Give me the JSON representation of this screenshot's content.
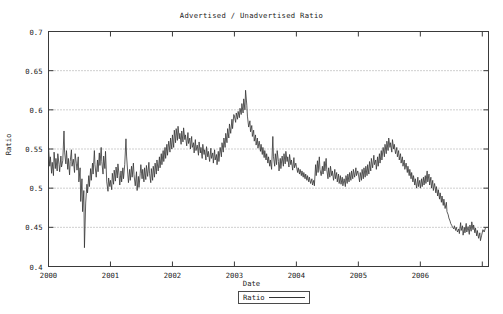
{
  "chart_data": {
    "type": "line",
    "title": "Advertised / Unadvertised Ratio",
    "xlabel": "Date",
    "ylabel": "Ratio",
    "ylim": [
      0.4,
      0.7
    ],
    "xlim": [
      2000.0,
      2007.1
    ],
    "yticks": [
      0.4,
      0.45,
      0.5,
      0.55,
      0.6,
      0.65,
      0.7
    ],
    "ytick_labels": [
      "0.4",
      "0.45",
      "0.5",
      "0.55",
      "0.6",
      "0.65",
      "0.7"
    ],
    "xticks": [
      2000,
      2001,
      2002,
      2003,
      2004,
      2005,
      2006,
      2007
    ],
    "xtick_labels": [
      "2000",
      "2001",
      "2002",
      "2003",
      "2004",
      "2005",
      "2006",
      ""
    ],
    "grid": "horizontal-dotted",
    "legend": {
      "position": "below-plot",
      "entries": [
        "Ratio"
      ]
    },
    "series": [
      {
        "name": "Ratio",
        "color": "#333333",
        "x": [
          2000.0,
          2000.02,
          2000.03,
          2000.05,
          2000.06,
          2000.08,
          2000.09,
          2000.11,
          2000.12,
          2000.14,
          2000.15,
          2000.17,
          2000.18,
          2000.2,
          2000.21,
          2000.23,
          2000.25,
          2000.26,
          2000.28,
          2000.29,
          2000.31,
          2000.32,
          2000.34,
          2000.35,
          2000.37,
          2000.38,
          2000.4,
          2000.42,
          2000.43,
          2000.45,
          2000.46,
          2000.48,
          2000.49,
          2000.51,
          2000.52,
          2000.54,
          2000.55,
          2000.57,
          2000.58,
          2000.6,
          2000.62,
          2000.63,
          2000.65,
          2000.66,
          2000.68,
          2000.69,
          2000.71,
          2000.72,
          2000.74,
          2000.75,
          2000.77,
          2000.79,
          2000.8,
          2000.82,
          2000.83,
          2000.85,
          2000.86,
          2000.88,
          2000.89,
          2000.91,
          2000.92,
          2000.94,
          2000.96,
          2000.97,
          2000.99,
          2001.0,
          2001.02,
          2001.03,
          2001.05,
          2001.06,
          2001.08,
          2001.09,
          2001.11,
          2001.12,
          2001.14,
          2001.15,
          2001.17,
          2001.18,
          2001.2,
          2001.21,
          2001.23,
          2001.25,
          2001.26,
          2001.28,
          2001.29,
          2001.31,
          2001.32,
          2001.34,
          2001.35,
          2001.37,
          2001.38,
          2001.4,
          2001.42,
          2001.43,
          2001.45,
          2001.46,
          2001.48,
          2001.49,
          2001.51,
          2001.52,
          2001.54,
          2001.55,
          2001.57,
          2001.58,
          2001.6,
          2001.62,
          2001.63,
          2001.65,
          2001.66,
          2001.68,
          2001.69,
          2001.71,
          2001.72,
          2001.74,
          2001.75,
          2001.77,
          2001.79,
          2001.8,
          2001.82,
          2001.83,
          2001.85,
          2001.86,
          2001.88,
          2001.89,
          2001.91,
          2001.92,
          2001.94,
          2001.96,
          2001.97,
          2001.99,
          2002.0,
          2002.02,
          2002.03,
          2002.05,
          2002.06,
          2002.08,
          2002.09,
          2002.11,
          2002.12,
          2002.14,
          2002.15,
          2002.17,
          2002.18,
          2002.2,
          2002.21,
          2002.23,
          2002.25,
          2002.26,
          2002.28,
          2002.29,
          2002.31,
          2002.32,
          2002.34,
          2002.35,
          2002.37,
          2002.38,
          2002.4,
          2002.42,
          2002.43,
          2002.45,
          2002.46,
          2002.48,
          2002.49,
          2002.51,
          2002.52,
          2002.54,
          2002.55,
          2002.57,
          2002.58,
          2002.6,
          2002.62,
          2002.63,
          2002.65,
          2002.66,
          2002.68,
          2002.69,
          2002.71,
          2002.72,
          2002.74,
          2002.75,
          2002.77,
          2002.79,
          2002.8,
          2002.82,
          2002.83,
          2002.85,
          2002.86,
          2002.88,
          2002.89,
          2002.91,
          2002.92,
          2002.94,
          2002.96,
          2002.97,
          2002.99,
          2003.0,
          2003.02,
          2003.03,
          2003.05,
          2003.06,
          2003.08,
          2003.09,
          2003.11,
          2003.12,
          2003.14,
          2003.15,
          2003.17,
          2003.18,
          2003.2,
          2003.21,
          2003.23,
          2003.25,
          2003.26,
          2003.28,
          2003.29,
          2003.31,
          2003.32,
          2003.34,
          2003.35,
          2003.37,
          2003.38,
          2003.4,
          2003.42,
          2003.43,
          2003.45,
          2003.46,
          2003.48,
          2003.49,
          2003.51,
          2003.52,
          2003.54,
          2003.55,
          2003.57,
          2003.58,
          2003.6,
          2003.62,
          2003.63,
          2003.65,
          2003.66,
          2003.68,
          2003.69,
          2003.71,
          2003.72,
          2003.74,
          2003.75,
          2003.77,
          2003.79,
          2003.8,
          2003.82,
          2003.83,
          2003.85,
          2003.86,
          2003.88,
          2003.89,
          2003.91,
          2003.92,
          2003.94,
          2003.96,
          2003.97,
          2003.99,
          2004.0,
          2004.02,
          2004.03,
          2004.05,
          2004.06,
          2004.08,
          2004.09,
          2004.11,
          2004.12,
          2004.14,
          2004.15,
          2004.17,
          2004.18,
          2004.2,
          2004.21,
          2004.23,
          2004.25,
          2004.26,
          2004.28,
          2004.29,
          2004.31,
          2004.32,
          2004.34,
          2004.35,
          2004.37,
          2004.38,
          2004.4,
          2004.42,
          2004.43,
          2004.45,
          2004.46,
          2004.48,
          2004.49,
          2004.51,
          2004.52,
          2004.54,
          2004.55,
          2004.57,
          2004.58,
          2004.6,
          2004.62,
          2004.63,
          2004.65,
          2004.66,
          2004.68,
          2004.69,
          2004.71,
          2004.72,
          2004.74,
          2004.75,
          2004.77,
          2004.79,
          2004.8,
          2004.82,
          2004.83,
          2004.85,
          2004.86,
          2004.88,
          2004.89,
          2004.91,
          2004.92,
          2004.94,
          2004.96,
          2004.97,
          2004.99,
          2005.0,
          2005.02,
          2005.03,
          2005.05,
          2005.06,
          2005.08,
          2005.09,
          2005.11,
          2005.12,
          2005.14,
          2005.15,
          2005.17,
          2005.18,
          2005.2,
          2005.21,
          2005.23,
          2005.25,
          2005.26,
          2005.28,
          2005.29,
          2005.31,
          2005.32,
          2005.34,
          2005.35,
          2005.37,
          2005.38,
          2005.4,
          2005.42,
          2005.43,
          2005.45,
          2005.46,
          2005.48,
          2005.49,
          2005.51,
          2005.52,
          2005.54,
          2005.55,
          2005.57,
          2005.58,
          2005.6,
          2005.62,
          2005.63,
          2005.65,
          2005.66,
          2005.68,
          2005.69,
          2005.71,
          2005.72,
          2005.74,
          2005.75,
          2005.77,
          2005.79,
          2005.8,
          2005.82,
          2005.83,
          2005.85,
          2005.86,
          2005.88,
          2005.89,
          2005.91,
          2005.92,
          2005.94,
          2005.96,
          2005.97,
          2005.99,
          2006.0,
          2006.02,
          2006.03,
          2006.05,
          2006.06,
          2006.08,
          2006.09,
          2006.11,
          2006.12,
          2006.14,
          2006.15,
          2006.17,
          2006.18,
          2006.2,
          2006.21,
          2006.23,
          2006.25,
          2006.26,
          2006.28,
          2006.29,
          2006.31,
          2006.32,
          2006.34,
          2006.35,
          2006.37,
          2006.38,
          2006.4,
          2006.42,
          2006.43,
          2006.45,
          2006.46,
          2006.48,
          2006.49,
          2006.51,
          2006.52,
          2006.54,
          2006.55,
          2006.57,
          2006.58,
          2006.6,
          2006.62,
          2006.63,
          2006.65,
          2006.66,
          2006.68,
          2006.69,
          2006.71,
          2006.72,
          2006.74,
          2006.75,
          2006.77,
          2006.79,
          2006.8,
          2006.82,
          2006.83,
          2006.85,
          2006.86,
          2006.88,
          2006.89,
          2006.91,
          2006.92,
          2006.94,
          2006.96,
          2006.97,
          2006.99,
          2007.01,
          2007.03,
          2007.05
        ],
        "y": [
          0.552,
          0.528,
          0.54,
          0.519,
          0.533,
          0.516,
          0.546,
          0.525,
          0.538,
          0.522,
          0.544,
          0.53,
          0.521,
          0.541,
          0.527,
          0.535,
          0.573,
          0.546,
          0.531,
          0.548,
          0.524,
          0.538,
          0.517,
          0.534,
          0.549,
          0.528,
          0.537,
          0.52,
          0.544,
          0.531,
          0.523,
          0.54,
          0.508,
          0.526,
          0.483,
          0.512,
          0.47,
          0.497,
          0.424,
          0.481,
          0.505,
          0.494,
          0.516,
          0.502,
          0.525,
          0.51,
          0.532,
          0.518,
          0.548,
          0.53,
          0.514,
          0.536,
          0.521,
          0.545,
          0.529,
          0.552,
          0.534,
          0.518,
          0.541,
          0.525,
          0.547,
          0.508,
          0.496,
          0.513,
          0.502,
          0.51,
          0.498,
          0.519,
          0.505,
          0.523,
          0.509,
          0.527,
          0.513,
          0.531,
          0.516,
          0.504,
          0.522,
          0.508,
          0.526,
          0.512,
          0.53,
          0.563,
          0.541,
          0.518,
          0.507,
          0.524,
          0.51,
          0.528,
          0.514,
          0.532,
          0.517,
          0.503,
          0.521,
          0.497,
          0.515,
          0.501,
          0.519,
          0.53,
          0.512,
          0.524,
          0.508,
          0.526,
          0.511,
          0.529,
          0.515,
          0.533,
          0.519,
          0.507,
          0.525,
          0.51,
          0.528,
          0.514,
          0.532,
          0.518,
          0.536,
          0.522,
          0.54,
          0.526,
          0.544,
          0.53,
          0.548,
          0.534,
          0.552,
          0.538,
          0.556,
          0.542,
          0.56,
          0.546,
          0.564,
          0.55,
          0.568,
          0.552,
          0.574,
          0.558,
          0.576,
          0.561,
          0.579,
          0.563,
          0.57,
          0.556,
          0.573,
          0.559,
          0.577,
          0.562,
          0.568,
          0.554,
          0.571,
          0.557,
          0.564,
          0.55,
          0.566,
          0.552,
          0.558,
          0.545,
          0.562,
          0.548,
          0.555,
          0.542,
          0.559,
          0.545,
          0.552,
          0.538,
          0.556,
          0.543,
          0.549,
          0.536,
          0.553,
          0.54,
          0.547,
          0.534,
          0.551,
          0.538,
          0.545,
          0.532,
          0.549,
          0.536,
          0.543,
          0.53,
          0.547,
          0.534,
          0.552,
          0.54,
          0.558,
          0.546,
          0.564,
          0.552,
          0.57,
          0.558,
          0.576,
          0.564,
          0.582,
          0.57,
          0.588,
          0.576,
          0.594,
          0.592,
          0.584,
          0.596,
          0.588,
          0.598,
          0.59,
          0.602,
          0.594,
          0.608,
          0.596,
          0.614,
          0.6,
          0.625,
          0.606,
          0.592,
          0.578,
          0.586,
          0.572,
          0.58,
          0.566,
          0.574,
          0.56,
          0.568,
          0.555,
          0.564,
          0.551,
          0.56,
          0.547,
          0.556,
          0.543,
          0.552,
          0.539,
          0.548,
          0.536,
          0.544,
          0.532,
          0.54,
          0.528,
          0.536,
          0.524,
          0.566,
          0.54,
          0.528,
          0.544,
          0.53,
          0.548,
          0.534,
          0.522,
          0.538,
          0.525,
          0.541,
          0.528,
          0.544,
          0.531,
          0.547,
          0.534,
          0.54,
          0.527,
          0.543,
          0.53,
          0.536,
          0.523,
          0.539,
          0.526,
          0.532,
          0.528,
          0.52,
          0.526,
          0.518,
          0.524,
          0.516,
          0.522,
          0.514,
          0.52,
          0.512,
          0.518,
          0.51,
          0.516,
          0.508,
          0.514,
          0.506,
          0.512,
          0.504,
          0.51,
          0.503,
          0.53,
          0.516,
          0.535,
          0.52,
          0.54,
          0.524,
          0.516,
          0.528,
          0.518,
          0.534,
          0.522,
          0.538,
          0.524,
          0.512,
          0.526,
          0.514,
          0.528,
          0.516,
          0.522,
          0.51,
          0.524,
          0.512,
          0.52,
          0.508,
          0.518,
          0.506,
          0.516,
          0.505,
          0.514,
          0.503,
          0.512,
          0.502,
          0.516,
          0.506,
          0.518,
          0.508,
          0.52,
          0.51,
          0.522,
          0.512,
          0.524,
          0.514,
          0.526,
          0.516,
          0.522,
          0.518,
          0.508,
          0.52,
          0.51,
          0.524,
          0.512,
          0.526,
          0.514,
          0.528,
          0.516,
          0.53,
          0.518,
          0.534,
          0.522,
          0.538,
          0.526,
          0.542,
          0.53,
          0.536,
          0.524,
          0.54,
          0.528,
          0.544,
          0.532,
          0.548,
          0.536,
          0.552,
          0.54,
          0.556,
          0.544,
          0.56,
          0.548,
          0.564,
          0.552,
          0.558,
          0.546,
          0.562,
          0.55,
          0.556,
          0.544,
          0.552,
          0.54,
          0.548,
          0.536,
          0.544,
          0.532,
          0.54,
          0.528,
          0.536,
          0.524,
          0.532,
          0.52,
          0.528,
          0.516,
          0.524,
          0.512,
          0.52,
          0.508,
          0.516,
          0.504,
          0.512,
          0.5,
          0.514,
          0.502,
          0.51,
          0.5,
          0.512,
          0.502,
          0.514,
          0.504,
          0.516,
          0.506,
          0.522,
          0.508,
          0.518,
          0.504,
          0.514,
          0.5,
          0.51,
          0.497,
          0.506,
          0.494,
          0.502,
          0.49,
          0.498,
          0.486,
          0.494,
          0.482,
          0.49,
          0.478,
          0.486,
          0.474,
          0.482,
          0.47,
          0.466,
          0.462,
          0.458,
          0.455,
          0.452,
          0.45,
          0.448,
          0.452,
          0.446,
          0.45,
          0.444,
          0.448,
          0.442,
          0.456,
          0.446,
          0.452,
          0.44,
          0.45,
          0.443,
          0.455,
          0.444,
          0.451,
          0.441,
          0.453,
          0.445,
          0.457,
          0.447,
          0.453,
          0.443,
          0.449,
          0.439,
          0.446,
          0.436,
          0.443,
          0.433,
          0.44,
          0.447,
          0.444,
          0.449
        ]
      }
    ]
  }
}
